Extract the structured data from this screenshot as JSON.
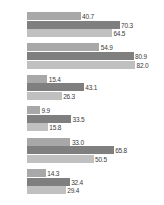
{
  "chart_data": {
    "type": "bar",
    "orientation": "horizontal",
    "grouped": true,
    "title": "",
    "subtitle": "",
    "xlabel": "",
    "ylabel": "",
    "grid": false,
    "legend_position": "top",
    "xlim": [
      0,
      82
    ],
    "categories": [
      "",
      "",
      "",
      "",
      "",
      ""
    ],
    "series": [
      {
        "name": "",
        "color": "#a8a8a8",
        "values": [
          40.7,
          54.9,
          15.4,
          9.9,
          33.0,
          14.3
        ],
        "labels": [
          "40.7",
          "54.9",
          "15.4",
          "9.9",
          "33.0",
          "14.3"
        ]
      },
      {
        "name": "",
        "color": "#7f7f7f",
        "values": [
          70.3,
          80.9,
          43.1,
          33.5,
          65.8,
          32.4
        ],
        "labels": [
          "70.3",
          "80.9",
          "43.1",
          "33.5",
          "65.8",
          "32.4"
        ]
      },
      {
        "name": "",
        "color": "#c0c0c0",
        "values": [
          64.5,
          82.0,
          26.3,
          15.8,
          50.5,
          29.4
        ],
        "labels": [
          "64.5",
          "82.0",
          "26.3",
          "15.8",
          "50.5",
          "29.4"
        ]
      }
    ]
  },
  "legend": {
    "entries": [
      {
        "label": "",
        "color": "#a8a8a8"
      },
      {
        "label": "",
        "color": "#7f7f7f"
      },
      {
        "label": "",
        "color": "#c0c0c0"
      }
    ]
  }
}
